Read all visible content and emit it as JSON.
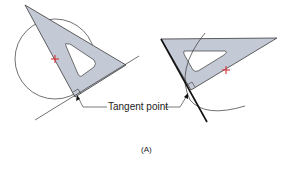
{
  "figure": {
    "tangent_label": "Tangent point",
    "caption": "(A)",
    "colors": {
      "triangle_fill": "#c4c9d6",
      "outline": "#333333",
      "center_mark": "#d8333a",
      "background": "#ffffff"
    },
    "left_panel": {
      "description": "Triangle with circle; tangent line drawn along triangle edge",
      "elements": [
        "circle",
        "triangle",
        "center-mark",
        "tangent-line",
        "right-angle-mark"
      ]
    },
    "right_panel": {
      "description": "Triangle with arc; bold tangent line drawn along triangle edge",
      "elements": [
        "arc",
        "triangle",
        "center-mark",
        "tangent-line",
        "right-angle-mark"
      ]
    }
  }
}
